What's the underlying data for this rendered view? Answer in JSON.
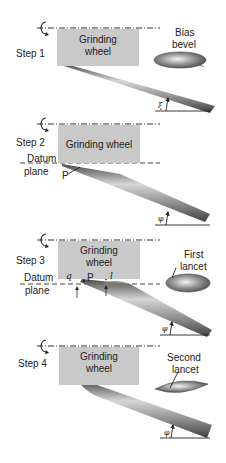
{
  "steps": [
    {
      "label": "Step 1",
      "wheel_label_line1": "Grinding",
      "wheel_label_line2": "wheel",
      "callout_line1": "Bias",
      "callout_line2": "bevel",
      "angle_symbol": "ξ"
    },
    {
      "label": "Step 2",
      "wheel_label": "Grinding wheel",
      "datum_line1": "Datum",
      "datum_line2": "plane",
      "point_label": "P",
      "angle_symbol": "φ"
    },
    {
      "label": "Step 3",
      "wheel_label_line1": "Grinding",
      "wheel_label_line2": "wheel",
      "datum_line1": "Datum",
      "datum_line2": "plane",
      "offset_q": "q",
      "point_label": "P",
      "offset_l": "l",
      "callout_line1": "First",
      "callout_line2": "lancet",
      "angle_symbol": "φ"
    },
    {
      "label": "Step 4",
      "wheel_label_line1": "Grinding",
      "wheel_label_line2": "wheel",
      "callout_line1": "Second",
      "callout_line2": "lancet",
      "angle_symbol": "φ"
    }
  ],
  "colors": {
    "wheel": "#c9c9c9",
    "needle_dark": "#5a5a5a",
    "needle_light": "#d8d8d8",
    "line": "#222222"
  }
}
